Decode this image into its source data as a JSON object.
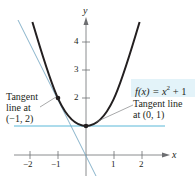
{
  "figure": {
    "function_label": {
      "prefix": "f(x) = x",
      "exp": "2",
      "suffix": " + 1"
    },
    "axes": {
      "x_label": "x",
      "y_label": "y",
      "x_ticks": [
        "−2",
        "−1",
        "1",
        "2"
      ],
      "y_ticks": [
        "2",
        "3",
        "4"
      ]
    },
    "annotations": {
      "left_tangent": [
        "Tangent",
        "line at",
        "(−1, 2)"
      ],
      "right_tangent": [
        "Tangent line",
        "at (0, 1)"
      ]
    },
    "colors": {
      "curve": "#231f20",
      "tangent": "#5bb8d8",
      "steep_tangent": "#7aaac4",
      "label_bg": "#e3f3f9",
      "axis": "#6d6e71"
    },
    "points": [
      {
        "x": -1,
        "y": 2
      },
      {
        "x": 0,
        "y": 1
      }
    ]
  }
}
